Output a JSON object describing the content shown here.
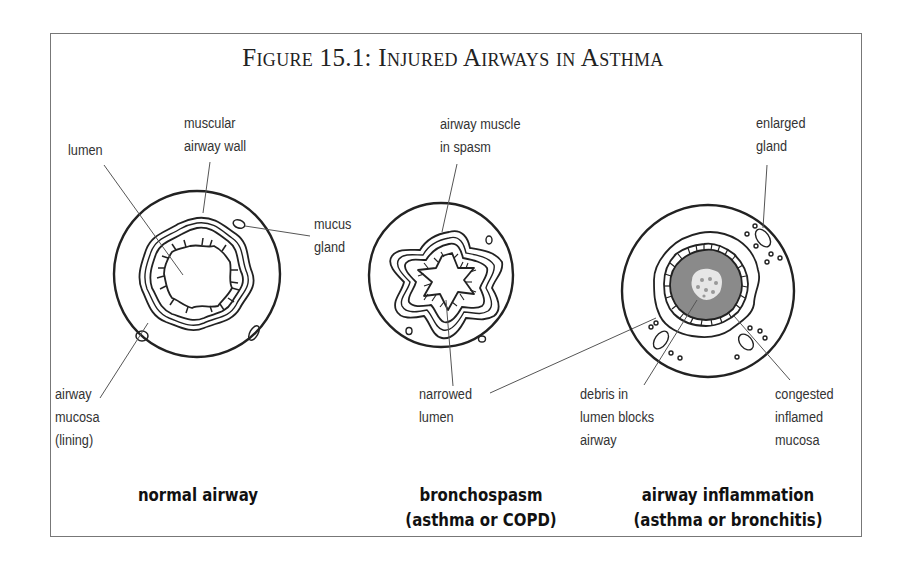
{
  "figure": {
    "title": "Figure 15.1: Injured Airways in Asthma"
  },
  "panels": [
    {
      "id": "normal",
      "caption_line1": "normal airway",
      "caption_line2": "",
      "labels": {
        "lumen": "lumen",
        "wall_line1": "muscular",
        "wall_line2": "airway wall",
        "gland_line1": "mucus",
        "gland_line2": "gland",
        "mucosa_line1": "airway",
        "mucosa_line2": "mucosa",
        "mucosa_line3": "(lining)"
      }
    },
    {
      "id": "bronchospasm",
      "caption_line1": "bronchospasm",
      "caption_line2": "(asthma or COPD)",
      "labels": {
        "muscle_line1": "airway muscle",
        "muscle_line2": "in spasm",
        "narrowed_line1": "narrowed",
        "narrowed_line2": "lumen"
      }
    },
    {
      "id": "inflammation",
      "caption_line1": "airway inflammation",
      "caption_line2": "(asthma or bronchitis)",
      "labels": {
        "gland_line1": "enlarged",
        "gland_line2": "gland",
        "debris_line1": "debris in",
        "debris_line2": "lumen blocks",
        "debris_line3": "airway",
        "congested_line1": "congested",
        "congested_line2": "inflamed",
        "congested_line3": "mucosa"
      }
    }
  ],
  "colors": {
    "line": "#222222",
    "leader": "#555555",
    "frame": "#777777",
    "inflamed_fill": "#8a8a8a",
    "debris_fill": "#e6e6e6"
  }
}
